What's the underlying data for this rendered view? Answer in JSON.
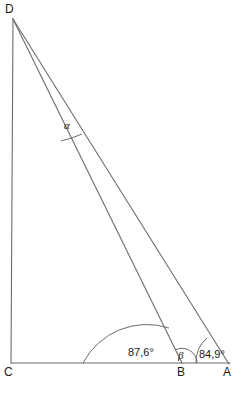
{
  "figure": {
    "type": "geometry-diagram",
    "background_color": "#ffffff",
    "stroke_color": "#6b6b6b",
    "text_color": "#1a1a1a"
  },
  "vertices": {
    "D": {
      "label": "D",
      "x": 13,
      "y": 19,
      "label_x": 5,
      "label_y": 13
    },
    "C": {
      "label": "C",
      "x": 11,
      "y": 363,
      "label_x": 4,
      "label_y": 376
    },
    "B": {
      "label": "B",
      "x": 182,
      "y": 363,
      "label_x": 178,
      "label_y": 376
    },
    "A": {
      "label": "A",
      "x": 228,
      "y": 363,
      "label_x": 224,
      "label_y": 376
    }
  },
  "segments": [
    {
      "name": "segment-DC",
      "from": "D",
      "to": "C"
    },
    {
      "name": "segment-CA",
      "from": "C",
      "to": "A"
    },
    {
      "name": "segment-DB",
      "from": "D",
      "to": "B"
    },
    {
      "name": "segment-DA",
      "from": "D",
      "to": "A"
    }
  ],
  "angles": [
    {
      "name": "angle-at-C",
      "vertex": "C",
      "label": "87,6°",
      "value": 87.6,
      "unit": "degrees",
      "arc_radius": 72,
      "label_x": 140,
      "label_y": 356,
      "label_class": "angle-label"
    },
    {
      "name": "angle-beta-at-B",
      "vertex": "B",
      "label": "β",
      "value": null,
      "unit": "degrees",
      "arc_radius": 15,
      "label_x": 178,
      "label_y": 359,
      "label_class": "greek-label"
    },
    {
      "name": "angle-at-A",
      "vertex": "A",
      "label": "84,9°",
      "value": 84.9,
      "unit": "degrees",
      "arc_radius": 32,
      "label_x": 199,
      "label_y": 358,
      "label_class": "angle-label"
    },
    {
      "name": "angle-alpha-at-D",
      "vertex": "D",
      "label": "α",
      "value": null,
      "unit": "degrees",
      "arc_radius": 122,
      "label_x": 64,
      "label_y": 129,
      "label_class": "greek-label"
    }
  ]
}
